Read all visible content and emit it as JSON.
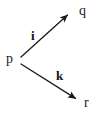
{
  "diagram": {
    "type": "directed-graph",
    "background_color": "#ffffff",
    "stroke_color": "#1a1a1a",
    "text_color": "#1a1a1a",
    "width": 97,
    "height": 117,
    "nodes": [
      {
        "id": "p",
        "label": "p",
        "x": 20,
        "y": 59
      },
      {
        "id": "q",
        "label": "q",
        "x": 83,
        "y": 11
      },
      {
        "id": "r",
        "label": "r",
        "x": 87,
        "y": 103
      }
    ],
    "edges": [
      {
        "id": "edge-i",
        "label": "i",
        "from": "p",
        "to": "q",
        "arrowhead": true,
        "x1": 21,
        "y1": 57,
        "x2": 70,
        "y2": 13,
        "label_x": 35,
        "label_y": 35
      },
      {
        "id": "edge-k",
        "label": "k",
        "from": "p",
        "to": "r",
        "arrowhead": true,
        "x1": 21,
        "y1": 64,
        "x2": 78,
        "y2": 100,
        "label_x": 59,
        "label_y": 76
      }
    ]
  }
}
